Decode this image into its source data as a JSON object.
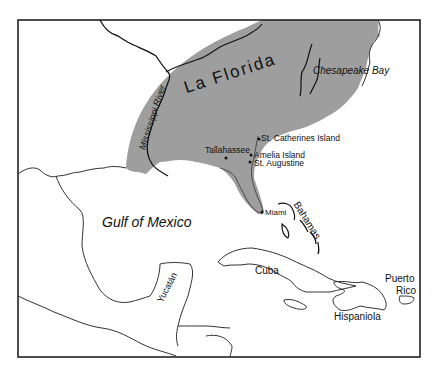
{
  "map": {
    "colors": {
      "region_fill": "#9e9e9e",
      "border": "#222222",
      "coast": "#333333",
      "background": "#ffffff"
    },
    "region": {
      "name": "La Florida"
    },
    "labels": {
      "la_florida": "La Florida",
      "mississippi": "Mississippi River",
      "chesapeake": "Chesapeake Bay",
      "st_catherines": "St. Catherines Island",
      "tallahassee": "Tallahassee",
      "amelia": "Amelia Island",
      "st_augustine": "St. Augustine",
      "miami": "Miami",
      "gulf": "Gulf of Mexico",
      "bahamas": "Bahamas",
      "yucatan": "Yucatán",
      "cuba": "Cuba",
      "puerto": "Puerto",
      "rico": "Rico",
      "hispaniola": "Hispaniola"
    }
  }
}
